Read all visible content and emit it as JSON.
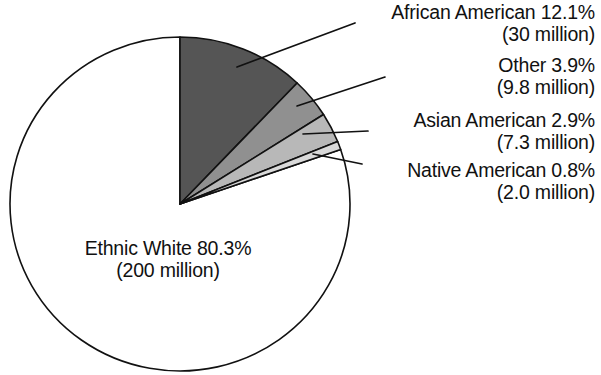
{
  "chart_data": {
    "type": "pie",
    "title": "",
    "subtitle": "",
    "xlabel": "",
    "ylabel": "",
    "legend_position": "callout-labels",
    "grid": false,
    "total_label": "",
    "start_angle_deg": 0,
    "direction": "clockwise",
    "categories": [
      "African American",
      "Other",
      "Asian American",
      "Native American",
      "Ethnic White"
    ],
    "values": [
      12.1,
      3.9,
      2.9,
      0.8,
      80.3
    ],
    "value_unit": "%",
    "counts": [
      30,
      9.8,
      7.3,
      2.0,
      200
    ],
    "count_unit": "million",
    "slices": [
      {
        "name": "African American",
        "percent": "12.1%",
        "percent_value": 12.1,
        "count": "(30 million)",
        "count_value": 30,
        "color": "#555555",
        "label_line1": "African American  12.1%",
        "label_line2": "(30 million)"
      },
      {
        "name": "Other",
        "percent": "3.9%",
        "percent_value": 3.9,
        "count": "(9.8 million)",
        "count_value": 9.8,
        "color": "#909090",
        "label_line1": "Other  3.9%",
        "label_line2": "(9.8 million)"
      },
      {
        "name": "Asian American",
        "percent": "2.9%",
        "percent_value": 2.9,
        "count": "(7.3 million)",
        "count_value": 7.3,
        "color": "#b8b8b8",
        "label_line1": "Asian American  2.9%",
        "label_line2": "(7.3 million)"
      },
      {
        "name": "Native American",
        "percent": "0.8%",
        "percent_value": 0.8,
        "count": "(2.0 million)",
        "count_value": 2.0,
        "color": "#d9d9d9",
        "label_line1": "Native American  0.8%",
        "label_line2": "(2.0 million)"
      },
      {
        "name": "Ethnic White",
        "percent": "80.3%",
        "percent_value": 80.3,
        "count": "(200 million)",
        "count_value": 200,
        "color": "#ffffff",
        "label_line1": "Ethnic White  80.3%",
        "label_line2": "(200 million)"
      }
    ],
    "colors": {
      "outline": "#111111",
      "background": "#ffffff",
      "african_american": "#555555",
      "other": "#909090",
      "asian_american": "#b8b8b8",
      "native_american": "#d9d9d9",
      "ethnic_white": "#ffffff"
    }
  }
}
